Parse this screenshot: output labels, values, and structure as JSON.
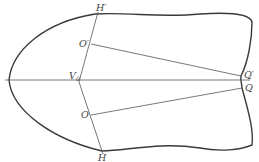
{
  "diagram": {
    "type": "geometric-construction",
    "colors": {
      "background": "#ffffff",
      "outline": "#3a3a3a",
      "lines": "#555555",
      "labels": "#444444"
    },
    "labels": {
      "H_prime": "H′",
      "O_prime": "O′",
      "V0_main": "V",
      "V0_sub": "0",
      "O": "O",
      "H": "H",
      "Q_prime": "Q′",
      "Q": "Q"
    },
    "points": {
      "H_prime": [
        98,
        14
      ],
      "O_prime": [
        91,
        44
      ],
      "V0": [
        82,
        80
      ],
      "O": [
        91,
        115
      ],
      "H": [
        102,
        151
      ],
      "Q_prime": [
        241,
        76
      ],
      "Q": [
        242,
        88
      ]
    },
    "segments": [
      {
        "name": "axis",
        "from": [
          5,
          80
        ],
        "to": [
          250,
          80
        ]
      },
      {
        "name": "H_prime-H",
        "from": [
          98,
          12
        ],
        "to": [
          103,
          154
        ]
      },
      {
        "name": "O_prime-Q_prime",
        "from": [
          91,
          44
        ],
        "to": [
          241,
          76
        ]
      },
      {
        "name": "O-Q",
        "from": [
          91,
          115
        ],
        "to": [
          242,
          88
        ]
      }
    ]
  }
}
